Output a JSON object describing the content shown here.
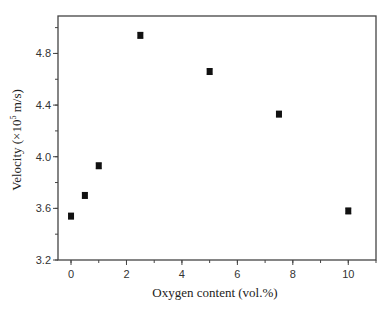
{
  "chart_data": {
    "type": "scatter",
    "title": "",
    "xlabel": "Oxygen content (vol.%)",
    "ylabel_main": "Velocity (×10",
    "ylabel_sup": "5",
    "ylabel_tail": " m/s)",
    "ylabel": "Velocity (×10^5 m/s)",
    "xlim": [
      -0.47,
      11.0
    ],
    "ylim": [
      3.2,
      5.09
    ],
    "xticks": [
      0,
      2,
      4,
      6,
      8,
      10
    ],
    "xtick_labels": [
      "0",
      "2",
      "4",
      "6",
      "8",
      "10"
    ],
    "xminor_step": 1,
    "yticks": [
      3.2,
      3.6,
      4.0,
      4.4,
      4.8
    ],
    "ytick_labels": [
      "3.2",
      "3.6",
      "4.0",
      "4.4",
      "4.8"
    ],
    "yminor_step": 0.2,
    "grid": false,
    "legend": null,
    "series": [
      {
        "name": "Velocity",
        "marker": "square",
        "color": "#111111",
        "x": [
          0,
          0.5,
          1.0,
          2.5,
          5.0,
          7.5,
          10.0
        ],
        "y": [
          3.54,
          3.7,
          3.93,
          4.94,
          4.66,
          4.33,
          3.58
        ],
        "yerr": [
          0.02,
          0.02,
          0.02,
          0.02,
          0.02,
          0.02,
          0.02
        ]
      }
    ]
  },
  "layout": {
    "plot_left": 58,
    "plot_right": 376,
    "plot_top": 16,
    "plot_bottom": 260
  }
}
